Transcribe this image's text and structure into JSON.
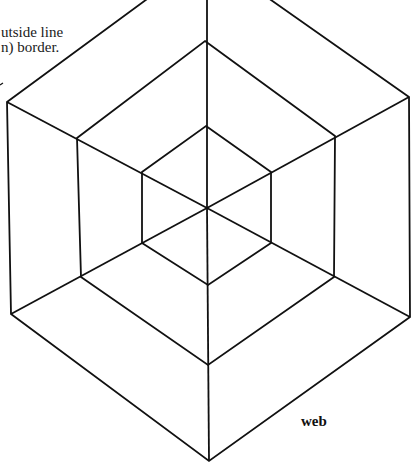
{
  "caption": {
    "lines": [
      "utside line",
      "n) border."
    ]
  },
  "labels": {
    "web": "web"
  },
  "colors": {
    "stroke": "#111111",
    "background": "#ffffff"
  },
  "diagram": {
    "type": "concentric-hexagon-web",
    "center": [
      207,
      208
    ],
    "stroke_width": 2,
    "hexagons": [
      {
        "name": "inner",
        "points": "206,126 271,172 271,243 208,285 142,243 142,172"
      },
      {
        "name": "middle",
        "points": "205,41 335,136 334,277 208,365 81,277 77,138"
      },
      {
        "name": "outer",
        "points": "207,-45 409,97 410,317 209,461 11,314 7,102"
      }
    ],
    "spokes": [
      {
        "x2": 207,
        "y2": -45
      },
      {
        "x2": 409,
        "y2": 97
      },
      {
        "x2": 410,
        "y2": 317
      },
      {
        "x2": 209,
        "y2": 461
      },
      {
        "x2": 11,
        "y2": 314
      },
      {
        "x2": 7,
        "y2": 102
      }
    ]
  }
}
